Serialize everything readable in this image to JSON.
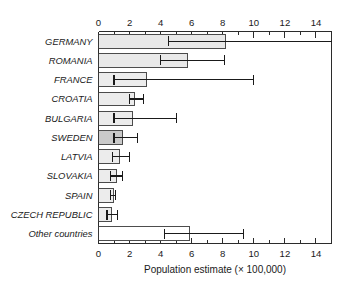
{
  "chart_data": {
    "type": "bar",
    "orientation": "horizontal",
    "title": "",
    "xlabel": "Population estimate (× 100,000)",
    "ylabel": "",
    "xlim": [
      0,
      15
    ],
    "xticks": [
      0,
      2,
      4,
      6,
      8,
      10,
      12,
      14
    ],
    "xtick_labels": [
      "0",
      "2",
      "4",
      "6",
      "8",
      "10",
      "12",
      "14"
    ],
    "minor_ticks": [
      1,
      3,
      5,
      7,
      9,
      11,
      13,
      15
    ],
    "grid": false,
    "legend": null,
    "axis_top": true,
    "axis_bottom": true,
    "categories": [
      "GERMANY",
      "ROMANIA",
      "FRANCE",
      "CROATIA",
      "BULGARIA",
      "SWEDEN",
      "LATVIA",
      "SLOVAKIA",
      "SPAIN",
      "CZECH REPUBLIC",
      "Other countries"
    ],
    "values": [
      8.2,
      5.7,
      3.1,
      2.3,
      2.2,
      1.55,
      1.35,
      1.15,
      0.95,
      0.85,
      5.85
    ],
    "error_low": [
      4.5,
      4.0,
      1.0,
      2.0,
      1.0,
      1.0,
      0.9,
      0.75,
      0.8,
      0.55,
      4.25
    ],
    "error_high": [
      15.0,
      8.1,
      10.0,
      2.9,
      5.0,
      2.5,
      2.0,
      1.55,
      1.1,
      1.2,
      9.35
    ],
    "error_high_clipped": [
      true,
      false,
      false,
      false,
      false,
      false,
      false,
      false,
      false,
      false,
      false
    ],
    "bar_fills": [
      "#e9e9e9",
      "#e9e9e9",
      "#ececec",
      "#ececec",
      "#ececec",
      "#c9c9c9",
      "#ececec",
      "#ececec",
      "#ececec",
      "#ececec",
      "#ffffff"
    ],
    "bar_edge_color": "#3a3a3a",
    "error_color": "#1a1a1a"
  },
  "figure": {
    "axis_title_text": "Population estimate (× 100,000)"
  }
}
